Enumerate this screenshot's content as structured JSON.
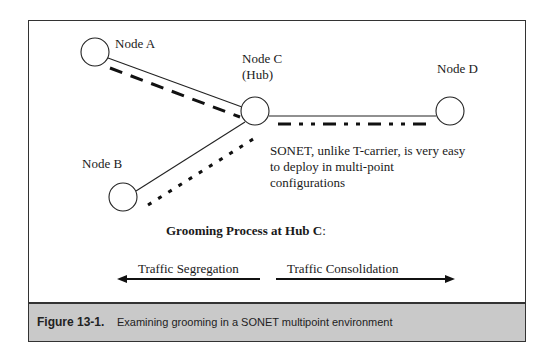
{
  "diagram": {
    "nodes": [
      {
        "id": "A",
        "label": "Node A",
        "cx": 95,
        "cy": 52,
        "r": 14
      },
      {
        "id": "B",
        "label": "Node B",
        "cx": 123,
        "cy": 197,
        "r": 14
      },
      {
        "id": "C",
        "label": "Node C",
        "sublabel": "(Hub)",
        "cx": 255,
        "cy": 111,
        "r": 14
      },
      {
        "id": "D",
        "label": "Node D",
        "cx": 450,
        "cy": 111,
        "r": 14
      }
    ],
    "links": [
      {
        "from": "A",
        "to": "C",
        "style": "solid"
      },
      {
        "from": "B",
        "to": "C",
        "style": "solid"
      },
      {
        "from": "C",
        "to": "D",
        "style": "solid"
      }
    ],
    "traffic_paths": [
      {
        "along": "A-C",
        "style": "dashed"
      },
      {
        "along": "B-C",
        "style": "dotted"
      },
      {
        "along": "C-D",
        "style": "dash-dot-dot"
      }
    ],
    "note": "SONET, unlike T-carrier, is very easy to deploy in multi-point configurations",
    "process_title": "Grooming Process at Hub C",
    "process_title_suffix": ":",
    "arrows": [
      {
        "label": "Traffic Segregation",
        "direction": "left"
      },
      {
        "label": "Traffic Consolidation",
        "direction": "right"
      }
    ]
  },
  "caption": {
    "number": "Figure 13-1.",
    "text": "Examining grooming in a SONET multipoint environment"
  }
}
